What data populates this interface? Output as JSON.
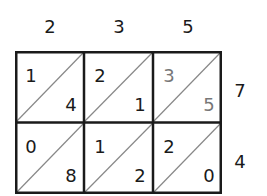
{
  "diagram": {
    "type": "lattice-multiplication",
    "top_factor_digits": [
      "2",
      "3",
      "5"
    ],
    "side_factor_digits": [
      "7",
      "4"
    ],
    "cells": [
      [
        {
          "tens": "1",
          "ones": "4",
          "color": "#1a1a1a"
        },
        {
          "tens": "2",
          "ones": "1",
          "color": "#1a1a1a"
        },
        {
          "tens": "3",
          "ones": "5",
          "color": "#777777"
        }
      ],
      [
        {
          "tens": "0",
          "ones": "8",
          "color": "#1a1a1a"
        },
        {
          "tens": "1",
          "ones": "2",
          "color": "#1a1a1a"
        },
        {
          "tens": "2",
          "ones": "0",
          "color": "#1a1a1a"
        }
      ]
    ],
    "colors": {
      "grid_line": "#1a1a1a",
      "diagonal": "#888888",
      "highlight_digit": "#777777",
      "digit": "#1a1a1a"
    }
  }
}
